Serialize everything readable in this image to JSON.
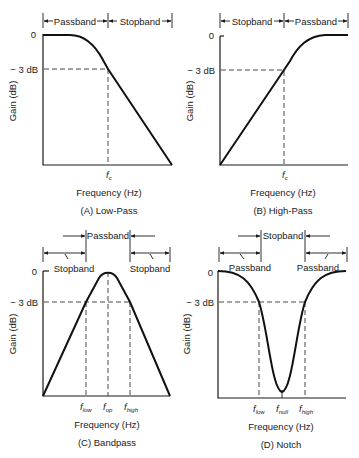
{
  "figure": {
    "panels": [
      {
        "id": "A",
        "caption": "(A) Low-Pass",
        "ylabel": "Gain (dB)",
        "xlabel": "Frequency (Hz)",
        "y_ticks": [
          "0",
          "− 3 dB"
        ],
        "x_markers": [
          {
            "main": "f",
            "sub": "c"
          }
        ],
        "bands": [
          "Passband",
          "Stopband"
        ]
      },
      {
        "id": "B",
        "caption": "(B) High-Pass",
        "ylabel": "Gain (dB)",
        "xlabel": "Frequency (Hz)",
        "y_ticks": [
          "0",
          "− 3 dB"
        ],
        "x_markers": [
          {
            "main": "f",
            "sub": "c"
          }
        ],
        "bands": [
          "Stopband",
          "Passband"
        ]
      },
      {
        "id": "C",
        "caption": "(C) Bandpass",
        "ylabel": "Gain (dB)",
        "xlabel": "Frequency (Hz)",
        "y_ticks": [
          "0",
          "− 3 dB"
        ],
        "x_markers": [
          {
            "main": "f",
            "sub": "low"
          },
          {
            "main": "f",
            "sub": "op"
          },
          {
            "main": "f",
            "sub": "high"
          }
        ],
        "bands": [
          "Stopband",
          "Passband",
          "Stopband"
        ]
      },
      {
        "id": "D",
        "caption": "(D) Notch",
        "ylabel": "Gain (dB)",
        "xlabel": "Frequency (Hz)",
        "y_ticks": [
          "0",
          "− 3 dB"
        ],
        "x_markers": [
          {
            "main": "f",
            "sub": "low"
          },
          {
            "main": "f",
            "sub": "null"
          },
          {
            "main": "f",
            "sub": "high"
          }
        ],
        "bands": [
          "Passband",
          "Stopband",
          "Passband"
        ]
      }
    ]
  }
}
